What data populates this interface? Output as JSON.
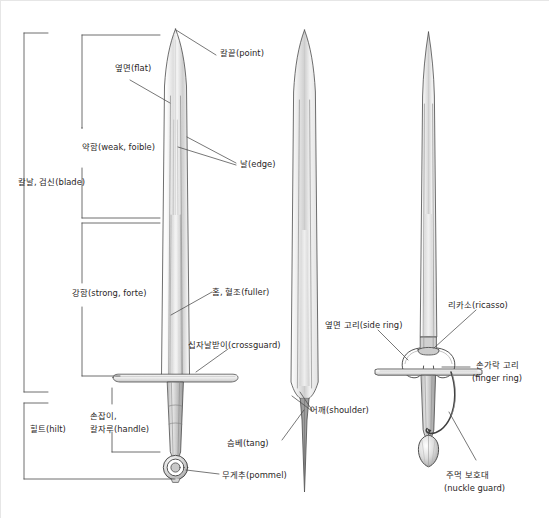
{
  "figure": {
    "type": "technical-illustration",
    "background_color": "#ffffff",
    "line_color": "#3a3a3a",
    "text_color": "#2a2626",
    "blade_fill_light": "#f2f2f2",
    "blade_fill_mid": "#d9d9d9",
    "blade_fill_dark": "#9a9a9a"
  },
  "swords": [
    {
      "name": "arming-sword",
      "caption_group": "left"
    },
    {
      "name": "bare-blade",
      "caption_group": "middle"
    },
    {
      "name": "side-sword",
      "caption_group": "right"
    }
  ],
  "labels": {
    "point": "칼끝(point)",
    "flat": "옆면(flat)",
    "weak_foible": "약함(weak, foible)",
    "edge": "날(edge)",
    "blade": "칼날, 검신(blade)",
    "strong_forte": "강함(strong, forte)",
    "fuller": "홈, 혈조(fuller)",
    "crossguard": "십자날받이(crossguard)",
    "hilt": "힐트(hilt)",
    "handle_line1": "손잡이,",
    "handle_line2": "칼자루(handle)",
    "tang": "슴베(tang)",
    "pommel": "무게추(pommel)",
    "shoulder": "어깨(shoulder)",
    "side_ring": "옆면 고리(side ring)",
    "ricasso": "리카소(ricasso)",
    "finger_ring_line1": "손가락 고리",
    "finger_ring_line2": "(finger ring)",
    "nuckle_guard_line1": "주먹 보호대",
    "nuckle_guard_line2": "(nuckle guard)"
  }
}
